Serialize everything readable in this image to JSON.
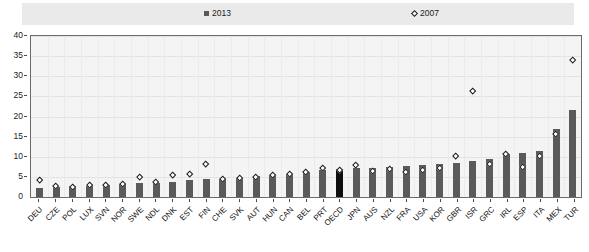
{
  "legend": {
    "series": [
      {
        "label": "2013",
        "marker": "square-marker",
        "color": "#595959"
      },
      {
        "label": "2007",
        "marker": "diamond-marker",
        "color": "#ffffff"
      }
    ]
  },
  "axis": {
    "y_ticks": [
      "0",
      "5",
      "10",
      "15",
      "20",
      "25",
      "30",
      "35",
      "40"
    ]
  },
  "chart_data": {
    "type": "bar",
    "title": "",
    "subtitle": "",
    "xlabel": "",
    "ylabel": "",
    "ylim": [
      0,
      40
    ],
    "ytick_step": 5,
    "grid": true,
    "legend_position": "top",
    "highlight_category": "OECD",
    "highlight_color": "#0d0d0d",
    "bar_color": "#5a5a5a",
    "categories": [
      "DEU",
      "CZE",
      "POL",
      "LUX",
      "SVN",
      "NOR",
      "SWE",
      "NDL",
      "DNK",
      "EST",
      "FIN",
      "CHE",
      "SVK",
      "AUT",
      "HUN",
      "CAN",
      "BEL",
      "PRT",
      "OECD",
      "JPN",
      "AUS",
      "NZL",
      "FRA",
      "USA",
      "KOR",
      "GBR",
      "ISR",
      "GRC",
      "IRL",
      "ESP",
      "ITA",
      "MEX",
      "TUR"
    ],
    "series": [
      {
        "name": "2013",
        "marker": "bar",
        "values": [
          2.2,
          2.4,
          2.7,
          2.8,
          3.1,
          3.2,
          3.4,
          3.6,
          3.8,
          4.2,
          4.4,
          4.6,
          4.8,
          5.2,
          5.4,
          5.8,
          6.2,
          6.6,
          7.0,
          7.1,
          7.2,
          7.4,
          7.6,
          7.9,
          8.1,
          8.4,
          9.0,
          9.4,
          10.6,
          10.9,
          11.4,
          17.0,
          21.6
        ]
      },
      {
        "name": "2007",
        "marker": "diamond",
        "values": [
          4.2,
          2.6,
          2.5,
          2.9,
          3.0,
          3.2,
          4.8,
          3.7,
          5.4,
          5.6,
          8.2,
          4.3,
          4.6,
          4.9,
          5.3,
          5.7,
          6.0,
          7.2,
          6.6,
          7.8,
          6.4,
          6.9,
          6.2,
          6.6,
          7.0,
          10.2,
          26.2,
          8.0,
          10.6,
          7.4,
          10.0,
          15.6,
          34.0
        ]
      }
    ]
  }
}
